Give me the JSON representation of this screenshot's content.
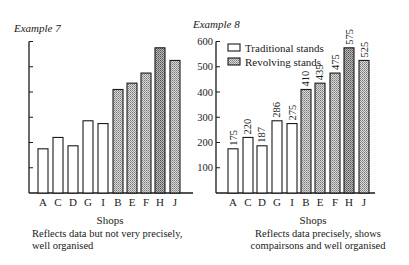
{
  "chart_data": [
    {
      "id": "example7",
      "type": "bar",
      "title": "Example 7",
      "xlabel": "Shops",
      "ylabel": "",
      "caption": [
        "Reflects data but not very precisely,",
        "well organised"
      ],
      "categories": [
        "A",
        "C",
        "D",
        "G",
        "I",
        "B",
        "E",
        "F",
        "H",
        "J"
      ],
      "values": [
        175,
        220,
        187,
        286,
        275,
        410,
        435,
        475,
        575,
        525
      ],
      "bar_groups": [
        "Traditional stands",
        "Traditional stands",
        "Traditional stands",
        "Traditional stands",
        "Traditional stands",
        "Revolving stands",
        "Revolving stands",
        "Revolving stands",
        "Revolving stands",
        "Revolving stands"
      ],
      "ylim": [
        0,
        600
      ],
      "yticks": [
        100,
        200,
        300,
        400,
        500,
        600
      ],
      "ytick_labels_shown": false,
      "value_labels_shown": false,
      "legend_shown": false,
      "grid": false
    },
    {
      "id": "example8",
      "type": "bar",
      "title": "Example 8",
      "xlabel": "Shops",
      "ylabel": "",
      "caption": [
        "Reflects data precisely, shows",
        "compairsons and well organised"
      ],
      "categories": [
        "A",
        "C",
        "D",
        "G",
        "I",
        "B",
        "E",
        "F",
        "H",
        "J"
      ],
      "series": [
        {
          "name": "Traditional stands",
          "categories": [
            "A",
            "C",
            "D",
            "G",
            "I"
          ],
          "values": [
            175,
            220,
            187,
            286,
            275
          ]
        },
        {
          "name": "Revolving stands",
          "categories": [
            "B",
            "E",
            "F",
            "H",
            "J"
          ],
          "values": [
            410,
            435,
            475,
            575,
            525
          ]
        }
      ],
      "values": [
        175,
        220,
        187,
        286,
        275,
        410,
        435,
        475,
        575,
        525
      ],
      "bar_groups": [
        "Traditional stands",
        "Traditional stands",
        "Traditional stands",
        "Traditional stands",
        "Traditional stands",
        "Revolving stands",
        "Revolving stands",
        "Revolving stands",
        "Revolving stands",
        "Revolving stands"
      ],
      "ylim": [
        0,
        600
      ],
      "yticks": [
        100,
        200,
        300,
        400,
        500,
        600
      ],
      "ytick_labels": [
        "100",
        "200",
        "300",
        "400",
        "500",
        "600"
      ],
      "ytick_labels_shown": true,
      "value_labels_shown": true,
      "value_label_orientation": "vertical",
      "legend_shown": true,
      "legend_position": "upper-left",
      "legend": [
        {
          "label": "Traditional stands",
          "fill": "plain"
        },
        {
          "label": "Revolving stands",
          "fill": "stippled"
        }
      ],
      "grid": false
    }
  ],
  "colors": {
    "ink": "#1a1a1a",
    "background": "#ffffff",
    "traditional_fill": "#ffffff",
    "revolving_fill": "#d9d9d9",
    "stipple_dot": "#7a7a7a"
  },
  "layout": {
    "example7": {
      "axis_x": 29,
      "axis_right": 193,
      "baseline": 193,
      "px_per_unit": 0.2525,
      "bar_x": [
        38,
        53,
        68,
        83,
        98,
        113,
        127,
        141,
        155,
        170
      ],
      "bar_w": 10
    },
    "example8": {
      "axis_x": 216,
      "axis_right": 375,
      "baseline": 193,
      "px_per_unit": 0.2525,
      "bar_x": [
        228,
        243,
        257,
        272,
        287,
        301,
        315,
        330,
        344,
        359
      ],
      "bar_w": 10
    }
  }
}
